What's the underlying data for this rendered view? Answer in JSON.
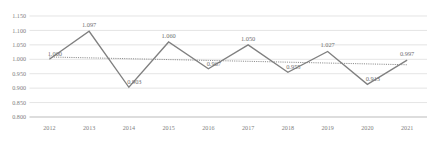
{
  "chart_data": {
    "type": "line",
    "title": "",
    "subtitle": "",
    "xlabel": "",
    "ylabel": "",
    "categories": [
      "2012",
      "2013",
      "2014",
      "2015",
      "2016",
      "2017",
      "2018",
      "2019",
      "2020",
      "2021"
    ],
    "series": [
      {
        "name": "value",
        "style": "solid",
        "color": "#808080",
        "values": [
          1.0,
          1.097,
          0.903,
          1.06,
          0.967,
          1.05,
          0.955,
          1.027,
          0.913,
          0.997
        ],
        "data_labels": [
          "1.000",
          "1.097",
          "0.903",
          "1.060",
          "0.967",
          "1.050",
          "0.955",
          "1.027",
          "0.913",
          "0.997"
        ]
      },
      {
        "name": "trendline",
        "style": "dotted",
        "color": "#8c8c8c",
        "values": [
          1.008,
          1.005,
          1.002,
          0.999,
          0.996,
          0.993,
          0.99,
          0.987,
          0.984,
          0.981
        ],
        "data_labels": []
      }
    ],
    "ylim": [
      0.8,
      1.15
    ],
    "ytick_step": 0.05,
    "ytick_labels": [
      "1.150",
      "1.100",
      "1.050",
      "1.000",
      "0.950",
      "0.900",
      "0.850",
      "0.800"
    ],
    "ytick_values": [
      1.15,
      1.1,
      1.05,
      1.0,
      0.95,
      0.9,
      0.85,
      0.8
    ],
    "grid": true,
    "grid_axis": "y",
    "legend": false,
    "legend_position": "none"
  }
}
